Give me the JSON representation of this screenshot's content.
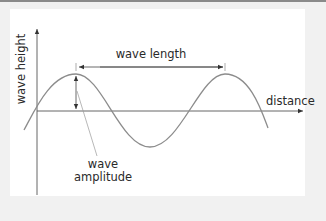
{
  "diagram": {
    "type": "labeled-wave",
    "axes": {
      "y_label": "wave height",
      "x_label": "distance"
    },
    "annotations": {
      "wave_length": "wave length",
      "amplitude_line1": "wave",
      "amplitude_line2": "amplitude"
    },
    "colors": {
      "background": "#f1f1f1",
      "panel": "#ffffff",
      "axis": "#333333",
      "wave": "#8c8c8c",
      "text": "#2a2a2a",
      "top_rule": "#8a8a8a"
    }
  }
}
